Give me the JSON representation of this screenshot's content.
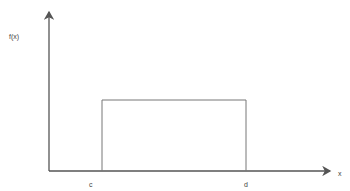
{
  "diagram": {
    "type": "uniform-distribution-pdf",
    "y_axis_label": "f(x)",
    "x_axis_label": "x",
    "lower_bound_label": "c",
    "upper_bound_label": "d",
    "colors": {
      "axis": "#555555",
      "rect": "#777777",
      "text": "#444444"
    }
  }
}
